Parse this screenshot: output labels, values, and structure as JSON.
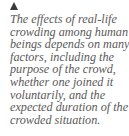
{
  "marker": {
    "icon": "triangle-up-icon",
    "color": "#3a3a3a"
  },
  "caption": {
    "lines": [
      "The effects of real-life",
      "crowding among human",
      "beings depends on many",
      "factors, including the",
      "purpose of the crowd,",
      "whether one joined it",
      "voluntarily, and the",
      "expected duration of the",
      "crowded situation."
    ],
    "color": "#5a5a5a"
  }
}
